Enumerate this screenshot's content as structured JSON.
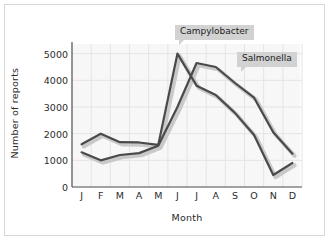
{
  "chart_data": {
    "type": "line",
    "title": "",
    "xlabel": "Month",
    "ylabel": "Number of reports",
    "categories": [
      "J",
      "F",
      "M",
      "A",
      "M",
      "J",
      "J",
      "A",
      "S",
      "O",
      "N",
      "D"
    ],
    "month_names": [
      "January",
      "February",
      "March",
      "April",
      "May",
      "June",
      "July",
      "August",
      "September",
      "October",
      "November",
      "December"
    ],
    "ylim": [
      0,
      5400
    ],
    "yticks": [
      0,
      1000,
      2000,
      3000,
      4000,
      5000
    ],
    "ytick_labels": [
      "0",
      "1000",
      "2000",
      "3000",
      "4000",
      "5000"
    ],
    "grid": true,
    "legend_position": "inline-callouts",
    "series": [
      {
        "name": "Campylobacter",
        "color": "#4a4a4a",
        "values": [
          1600,
          2000,
          1680,
          1670,
          1580,
          5000,
          3800,
          3450,
          2780,
          1950,
          450,
          900
        ]
      },
      {
        "name": "Salmonella",
        "color": "#4a4a4a",
        "values": [
          1300,
          1000,
          1200,
          1270,
          1550,
          3000,
          4650,
          4500,
          3900,
          3350,
          2050,
          1250
        ]
      }
    ],
    "annotations": [
      {
        "label": "Campylobacter",
        "points_to": "June peak of Campylobacter series"
      },
      {
        "label": "Salmonella",
        "points_to": "August value of Salmonella series"
      }
    ]
  },
  "colors": {
    "line": "#4a4a4a",
    "line_shadow": "#c9c9c9",
    "axis": "#555555",
    "grid": "#e6e6e6",
    "plot_background": "#f7f7f7",
    "callout_background": "#d2d2d2",
    "frame_border": "#d7d7d7",
    "text": "#2b2b2b"
  }
}
